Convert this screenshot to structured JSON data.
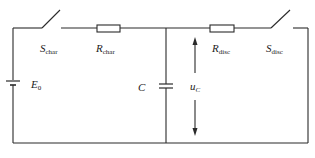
{
  "diagram": {
    "type": "RC charge/discharge circuit",
    "components": {
      "source": {
        "symbol": "E",
        "subscript": "0"
      },
      "switch_charge": {
        "symbol": "S",
        "subscript": "char"
      },
      "resistor_charge": {
        "symbol": "R",
        "subscript": "char"
      },
      "capacitor": {
        "symbol": "C"
      },
      "voltage": {
        "symbol": "u",
        "subscript": "C"
      },
      "resistor_discharge": {
        "symbol": "R",
        "subscript": "disc"
      },
      "switch_discharge": {
        "symbol": "S",
        "subscript": "disc"
      }
    },
    "colors": {
      "line": "#2a2a2a",
      "text": "#222222",
      "background": "#ffffff"
    }
  }
}
